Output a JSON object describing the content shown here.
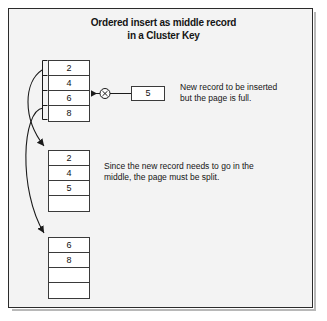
{
  "figure": {
    "title_line1": "Ordered insert as middle record",
    "title_line2": "in a Cluster Key",
    "border_color": "#2b2b2b",
    "background_color": "#f3f3f3",
    "line_color": "#1a1a1a"
  },
  "blocks": [
    {
      "name": "original-page",
      "rows": [
        "2",
        "4",
        "6",
        "8"
      ]
    },
    {
      "name": "split-page-first",
      "rows": [
        "2",
        "4",
        "5",
        ""
      ]
    },
    {
      "name": "split-page-second",
      "rows": [
        "6",
        "8",
        "",
        ""
      ]
    }
  ],
  "new_record": {
    "value": "5",
    "marker": "circled-x"
  },
  "captions": {
    "insert": {
      "line1": "New record to be inserted",
      "line2": "but the page is full."
    },
    "split": {
      "line1": "Since the new record needs to go in the",
      "line2": "middle, the page must be split."
    }
  }
}
